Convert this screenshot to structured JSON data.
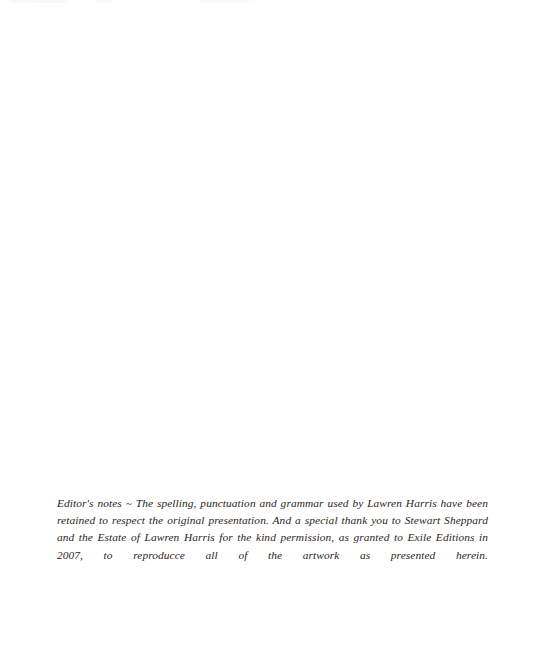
{
  "page": {
    "kind": "scanned-book-page",
    "background_color": "#ffffff",
    "ink_color": "#2b2622",
    "width": 543,
    "height": 670
  },
  "editor_note": {
    "label": "Editor's notes",
    "separator": "~",
    "text": "Editor's notes ~ The spelling, punctuation and grammar used by Lawren Harris have been retained to respect the original presentation. And a special thank you to Stewart Sheppard and the Estate of Lawren Harris for the kind permission, as granted to Exile Editions in 2007, to reproducce all of the artwork as presented herein.",
    "lines": [
      "Editor's notes ~ The spelling, punctuation and grammar used by Lawren Harris have been",
      "retained to respect the original presentation. And a special thank you to Stewart Sheppard and",
      "the Estate of Lawren Harris for the kind permission, as granted to Exile Editions in 2007, to",
      "reproducce all of the artwork as presented herein."
    ],
    "mentions": {
      "artist": "Lawren Harris",
      "acknowledged_person": "Stewart Sheppard",
      "rights_holder": "the Estate of Lawren Harris",
      "publisher": "Exile Editions",
      "year": "2007"
    }
  }
}
